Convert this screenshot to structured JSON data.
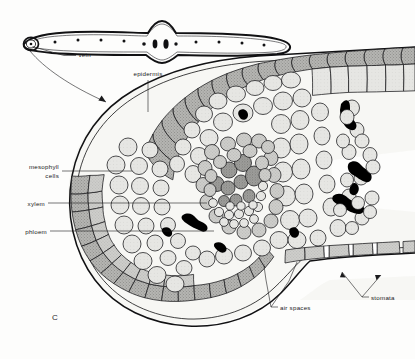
{
  "figure": {
    "panel_letter": "C",
    "background_color": "#fdfdfc",
    "ink_color": "#17171a"
  },
  "labels": {
    "vein": "vein",
    "epidermis": "epidermis",
    "mesophyll_line1": "mesophyll",
    "mesophyll_line2": "cells",
    "xylem": "xylem",
    "phloem": "phloem",
    "air_spaces": "air spaces",
    "stomata": "stomata"
  },
  "overview_leaf": {
    "name": "whole-leaf-transverse-outline",
    "vein_dot_count": 9,
    "midrib_bundle_count": 3,
    "callout_circle": "magnified-region-marker"
  },
  "tissues": [
    {
      "name": "upper-epidermis",
      "fill": "#b9b9b7",
      "note": "darker stippled outer cell layer"
    },
    {
      "name": "lower-epidermis",
      "fill": "#b9b9b7",
      "note": "darker stippled outer cell layer"
    },
    {
      "name": "mesophyll",
      "fill": "#e3e3e0",
      "note": "pale loosely packed parenchyma"
    },
    {
      "name": "bundle-sheath",
      "fill": "#cfcfcc",
      "note": "ring around vascular bundle"
    },
    {
      "name": "xylem",
      "fill": "#9a9a97",
      "note": "large dark stippled cells, upper bundle"
    },
    {
      "name": "phloem",
      "fill": "#d2d2ce",
      "note": "small cells, lower bundle"
    },
    {
      "name": "air-space",
      "fill": "#000000",
      "note": "black intercellular gaps"
    }
  ]
}
